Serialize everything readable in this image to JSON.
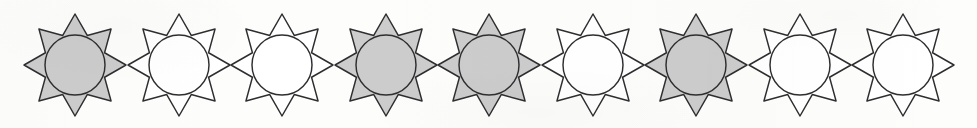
{
  "figure": {
    "item_count": 9,
    "shape_name": "eight-pointed-star-with-inscribed-circle",
    "star_points": 8,
    "colors": {
      "background": "#fdfdfc",
      "outline": "#2e2e30",
      "shaded_fill": "#cccccc",
      "unshaded_fill": "#ffffff",
      "circle_shaded_fill": "#c9c9c9",
      "circle_unshaded_fill": "#ffffff"
    },
    "geometry": {
      "star_width": 100,
      "star_height": 102,
      "spacing": 103.5,
      "first_center_x": 75,
      "center_y": 65,
      "circle_radius": 30,
      "outer_radius": 51,
      "inner_radius": 32
    },
    "items": [
      {
        "index": 1,
        "fill": "shaded",
        "fill_color": "#cccccc",
        "circle_fill": "#c9c9c9",
        "center_x": 75,
        "label": "star-1-shaded"
      },
      {
        "index": 2,
        "fill": "unshaded",
        "fill_color": "#ffffff",
        "circle_fill": "#ffffff",
        "center_x": 179,
        "label": "star-2-unshaded"
      },
      {
        "index": 3,
        "fill": "unshaded",
        "fill_color": "#ffffff",
        "circle_fill": "#ffffff",
        "center_x": 282,
        "label": "star-3-unshaded"
      },
      {
        "index": 4,
        "fill": "shaded",
        "fill_color": "#cccccc",
        "circle_fill": "#c9c9c9",
        "center_x": 386,
        "label": "star-4-shaded"
      },
      {
        "index": 5,
        "fill": "shaded",
        "fill_color": "#cccccc",
        "circle_fill": "#c9c9c9",
        "center_x": 489,
        "label": "star-5-shaded"
      },
      {
        "index": 6,
        "fill": "unshaded",
        "fill_color": "#ffffff",
        "circle_fill": "#ffffff",
        "center_x": 593,
        "label": "star-6-unshaded"
      },
      {
        "index": 7,
        "fill": "shaded",
        "fill_color": "#cccccc",
        "circle_fill": "#c9c9c9",
        "center_x": 696,
        "label": "star-7-shaded"
      },
      {
        "index": 8,
        "fill": "unshaded",
        "fill_color": "#ffffff",
        "circle_fill": "#ffffff",
        "center_x": 800,
        "label": "star-8-unshaded"
      },
      {
        "index": 9,
        "fill": "unshaded",
        "fill_color": "#ffffff",
        "circle_fill": "#ffffff",
        "center_x": 903,
        "label": "star-9-unshaded"
      }
    ],
    "fill_pattern": [
      "shaded",
      "unshaded",
      "unshaded",
      "shaded",
      "shaded",
      "unshaded",
      "shaded",
      "unshaded",
      "unshaded"
    ]
  }
}
